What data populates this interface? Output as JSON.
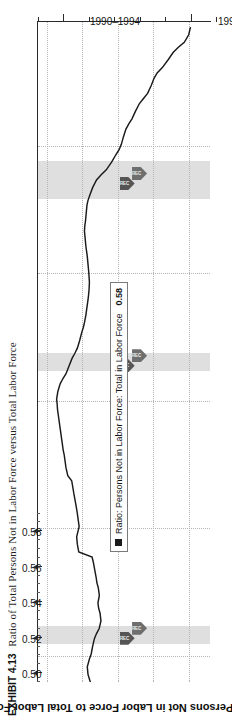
{
  "exhibit": {
    "label": "EXHIBIT 4.13",
    "caption": "Ratio of Total Persons Not in Labor Force versus Total Labor Force"
  },
  "chart_title": "Ratio: Persons Not in Labor Force to Total Labor Force",
  "legend": {
    "series_label": "Ratio: Persons Not in Labor Force: Total in Labor Force",
    "value": "0.58",
    "marker": "black-square"
  },
  "markers": {
    "badge_text": "REC",
    "badge_name": "recession-badge"
  },
  "colors": {
    "line": "#1a1a1a",
    "axis": "#2a2a2a",
    "grid": "#b4b4b4",
    "recession_band": "#d9d9d9",
    "badge": "#6e6e6e"
  },
  "chart_data": {
    "type": "line",
    "title": "Ratio: Persons Not in Labor Force to Total Labor Force",
    "xlabel": "",
    "ylabel": "",
    "orientation": "rotated-90-ccw",
    "grid": true,
    "legend_position": "inside-lower-left",
    "ylim": [
      0.495,
      0.592
    ],
    "yticks": [
      0.58,
      0.56,
      0.54,
      0.52,
      0.5
    ],
    "ytick_labels": [
      "0.58",
      "0.56",
      "0.54",
      "0.52",
      "0.50"
    ],
    "y_minor_step": 0.01,
    "xlim": [
      1989.0,
      2014.9
    ],
    "xticks": [
      1992,
      1997,
      2002,
      2007,
      2012
    ],
    "xtick_labels": [
      "1990–1994",
      "1995–1999",
      "2000–2004",
      "2005–2009",
      "2010–2014"
    ],
    "x_gridlines": [
      1990,
      1995,
      2000,
      2005,
      2010
    ],
    "recession_bands": [
      {
        "start": 1990.5,
        "end": 1991.2
      },
      {
        "start": 2001.2,
        "end": 2001.9
      },
      {
        "start": 2007.95,
        "end": 2009.45
      }
    ],
    "series": [
      {
        "name": "Ratio: Persons Not in Labor Force: Total in Labor Force",
        "x": [
          1989.0,
          1989.3,
          1989.6,
          1989.9,
          1990.1,
          1990.4,
          1990.7,
          1990.9,
          1991.1,
          1991.4,
          1991.7,
          1991.9,
          1992.1,
          1992.4,
          1992.7,
          1992.9,
          1993.1,
          1993.4,
          1993.7,
          1993.9,
          1994.1,
          1994.4,
          1994.7,
          1994.9,
          1995.1,
          1995.4,
          1995.7,
          1995.9,
          1996.1,
          1996.4,
          1996.7,
          1996.9,
          1997.1,
          1997.4,
          1997.7,
          1997.9,
          1998.1,
          1998.4,
          1998.7,
          1998.9,
          1999.1,
          1999.4,
          1999.7,
          1999.9,
          2000.1,
          2000.4,
          2000.7,
          2000.9,
          2001.1,
          2001.4,
          2001.7,
          2001.9,
          2002.1,
          2002.4,
          2002.7,
          2002.9,
          2003.1,
          2003.4,
          2003.7,
          2003.9,
          2004.1,
          2004.4,
          2004.7,
          2004.9,
          2005.1,
          2005.4,
          2005.7,
          2005.9,
          2006.1,
          2006.4,
          2006.7,
          2006.9,
          2007.1,
          2007.4,
          2007.7,
          2007.9,
          2008.1,
          2008.4,
          2008.7,
          2008.9,
          2009.1,
          2009.4,
          2009.7,
          2009.9,
          2010.1,
          2010.4,
          2010.7,
          2010.9,
          2011.1,
          2011.4,
          2011.7,
          2011.9,
          2012.1,
          2012.4,
          2012.7,
          2012.9,
          2013.1,
          2013.4,
          2013.7,
          2013.9,
          2014.1,
          2014.4,
          2014.7
        ],
        "y": [
          0.5245,
          0.5232,
          0.5228,
          0.524,
          0.525,
          0.5258,
          0.5268,
          0.528,
          0.5295,
          0.5305,
          0.53,
          0.5292,
          0.5288,
          0.5296,
          0.529,
          0.5282,
          0.5278,
          0.527,
          0.5262,
          0.5255,
          0.518,
          0.5172,
          0.5168,
          0.5175,
          0.5182,
          0.5176,
          0.517,
          0.5165,
          0.516,
          0.5152,
          0.5145,
          0.514,
          0.5118,
          0.5108,
          0.5102,
          0.5098,
          0.5092,
          0.5086,
          0.508,
          0.5076,
          0.5072,
          0.5066,
          0.506,
          0.5058,
          0.5055,
          0.5062,
          0.5075,
          0.509,
          0.5108,
          0.5125,
          0.5142,
          0.5158,
          0.5172,
          0.5185,
          0.5196,
          0.5205,
          0.5212,
          0.522,
          0.5226,
          0.523,
          0.5234,
          0.5238,
          0.524,
          0.5238,
          0.5236,
          0.5232,
          0.5228,
          0.5224,
          0.522,
          0.5216,
          0.5212,
          0.5214,
          0.5218,
          0.5222,
          0.5226,
          0.5232,
          0.5242,
          0.5258,
          0.528,
          0.5305,
          0.5335,
          0.5365,
          0.539,
          0.5408,
          0.542,
          0.5432,
          0.5446,
          0.5462,
          0.548,
          0.55,
          0.5522,
          0.5545,
          0.5568,
          0.5588,
          0.5605,
          0.5622,
          0.565,
          0.5682,
          0.5712,
          0.574,
          0.5775,
          0.58,
          0.581
        ]
      }
    ]
  }
}
